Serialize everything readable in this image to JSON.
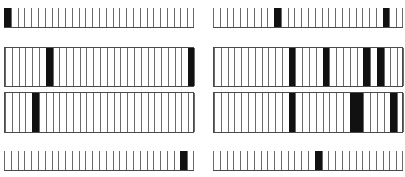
{
  "diagram": {
    "cells_per_strip": 28,
    "colors": {
      "line": "#6a6a6a",
      "filled": "#111111",
      "background": "#ffffff"
    },
    "strips": [
      {
        "id": "row1-left",
        "style": "comb",
        "x": 4,
        "y": 8,
        "w": 190,
        "h": 20,
        "filled": [
          0
        ]
      },
      {
        "id": "row1-right",
        "style": "comb",
        "x": 213,
        "y": 8,
        "w": 190,
        "h": 20,
        "filled": [
          9,
          25
        ]
      },
      {
        "id": "row2-left",
        "style": "boxed",
        "x": 4,
        "y": 47,
        "w": 190,
        "h": 40,
        "filled": [
          6,
          27
        ]
      },
      {
        "id": "row2-right",
        "style": "boxed",
        "x": 213,
        "y": 47,
        "w": 190,
        "h": 40,
        "filled": [
          11,
          16,
          22,
          24
        ]
      },
      {
        "id": "row3-left",
        "style": "boxed",
        "x": 4,
        "y": 92,
        "w": 190,
        "h": 41,
        "filled": [
          4
        ]
      },
      {
        "id": "row3-right",
        "style": "boxed",
        "x": 213,
        "y": 92,
        "w": 190,
        "h": 41,
        "filled": [
          11,
          20,
          21,
          26
        ]
      },
      {
        "id": "row4-left",
        "style": "comb",
        "x": 4,
        "y": 151,
        "w": 190,
        "h": 20,
        "filled": [
          26
        ]
      },
      {
        "id": "row4-right",
        "style": "comb",
        "x": 213,
        "y": 151,
        "w": 190,
        "h": 20,
        "filled": [
          15
        ]
      }
    ]
  }
}
